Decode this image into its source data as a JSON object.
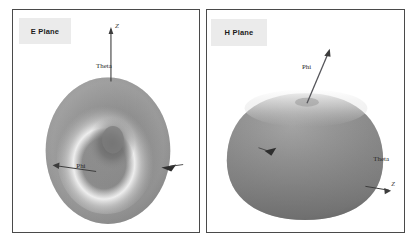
{
  "figure": {
    "background_color": "#ffffff",
    "border_color": "#4a4a4a",
    "label_background": "#ebebeb",
    "surface_color": "#8a8a8a",
    "highlight_color": "#f2f2f2"
  },
  "panels": [
    {
      "id": "e-plane",
      "label": "E Plane",
      "shape_description": "toroidal radiation pattern viewed face-on",
      "annotations": [
        {
          "name": "z-axis-label",
          "text": "Z"
        },
        {
          "name": "theta-label",
          "text": "Theta"
        },
        {
          "name": "phi-label",
          "text": "Phi"
        }
      ]
    },
    {
      "id": "h-plane",
      "label": "H Plane",
      "shape_description": "rounded oblate radiation pattern viewed from the side",
      "annotations": [
        {
          "name": "phi-label",
          "text": "Phi"
        },
        {
          "name": "theta-label",
          "text": "Theta"
        },
        {
          "name": "axis-tick-label",
          "text": "Z"
        }
      ]
    }
  ]
}
